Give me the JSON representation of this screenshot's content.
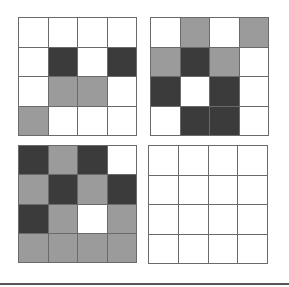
{
  "legend": {
    "0": "white",
    "1": "gray",
    "2": "dark"
  },
  "colors": {
    "white": "#ffffff",
    "gray": "#9b9b9b",
    "dark": "#3b3b3b",
    "line": "#6a6a6a"
  },
  "grids": [
    {
      "name": "top-left",
      "cells": [
        [
          0,
          0,
          0,
          0
        ],
        [
          0,
          2,
          0,
          2
        ],
        [
          0,
          1,
          1,
          0
        ],
        [
          1,
          0,
          0,
          0
        ]
      ]
    },
    {
      "name": "top-right",
      "cells": [
        [
          0,
          1,
          0,
          1
        ],
        [
          1,
          2,
          1,
          0
        ],
        [
          2,
          0,
          2,
          0
        ],
        [
          0,
          2,
          2,
          0
        ]
      ]
    },
    {
      "name": "bottom-left",
      "cells": [
        [
          2,
          1,
          2,
          0
        ],
        [
          1,
          2,
          1,
          2
        ],
        [
          2,
          1,
          0,
          1
        ],
        [
          1,
          1,
          1,
          1
        ]
      ]
    },
    {
      "name": "bottom-right",
      "cells": [
        [
          0,
          0,
          0,
          0
        ],
        [
          0,
          0,
          0,
          0
        ],
        [
          0,
          0,
          0,
          0
        ],
        [
          0,
          0,
          0,
          0
        ]
      ]
    }
  ]
}
